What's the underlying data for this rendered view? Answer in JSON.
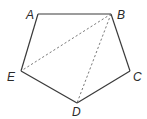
{
  "figure": {
    "type": "pentagon",
    "vertices": [
      {
        "label": "A",
        "x": 38,
        "y": 14,
        "label_x": 26,
        "label_y": 19
      },
      {
        "label": "B",
        "x": 111,
        "y": 14,
        "label_x": 117,
        "label_y": 19
      },
      {
        "label": "C",
        "x": 130,
        "y": 71,
        "label_x": 133,
        "label_y": 81
      },
      {
        "label": "D",
        "x": 77,
        "y": 103,
        "label_x": 72,
        "label_y": 116
      },
      {
        "label": "E",
        "x": 21,
        "y": 71,
        "label_x": 7,
        "label_y": 81
      }
    ],
    "sides": [
      {
        "from": "A",
        "to": "B",
        "style": "solid"
      },
      {
        "from": "B",
        "to": "C",
        "style": "solid"
      },
      {
        "from": "C",
        "to": "D",
        "style": "solid"
      },
      {
        "from": "D",
        "to": "E",
        "style": "solid"
      },
      {
        "from": "E",
        "to": "A",
        "style": "solid"
      }
    ],
    "diagonals": [
      {
        "from": "B",
        "to": "E",
        "style": "dashed"
      },
      {
        "from": "B",
        "to": "D",
        "style": "dashed"
      }
    ],
    "colors": {
      "edge": "#3a3a3a",
      "diagonal": "#6a6a6a",
      "label": "#2a2a2a",
      "background": "#ffffff"
    }
  }
}
